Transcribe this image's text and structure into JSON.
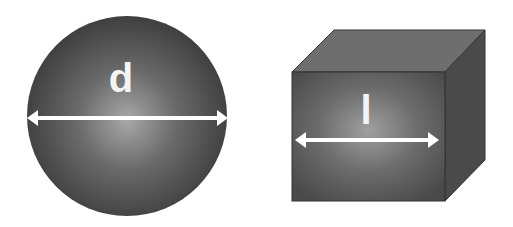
{
  "diagram": {
    "sphere": {
      "label": "d",
      "description": "sphere diameter"
    },
    "cube": {
      "label": "l",
      "description": "cube edge length"
    }
  },
  "colors": {
    "background": "#ffffff",
    "shape_dark": "#3a3a3a",
    "shape_light": "#9a9a9a",
    "arrow": "#ffffff"
  }
}
